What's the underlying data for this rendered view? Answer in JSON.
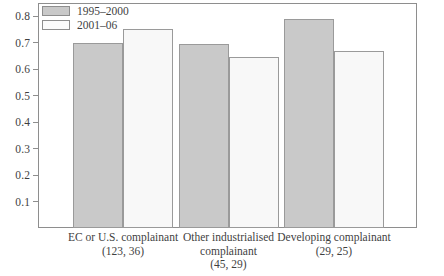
{
  "chart_data": {
    "type": "bar",
    "title": "",
    "subtitle": "",
    "xlabel": "",
    "ylabel": "",
    "ylim": [
      0,
      0.85
    ],
    "grid": false,
    "legend_position": "top-left",
    "categories": [
      "EC or U.S. complainant",
      "Other industrialised complainant",
      "Developing complainant"
    ],
    "category_counts": [
      "(123, 36)",
      "(45, 29)",
      "(29, 25)"
    ],
    "series": [
      {
        "name": "1995–2000",
        "color": "#c9c9c9",
        "values": [
          0.7,
          0.695,
          0.79
        ]
      },
      {
        "name": "2001–06",
        "color": "#f8f8f8",
        "values": [
          0.75,
          0.645,
          0.67
        ]
      }
    ],
    "yticks": [
      0.1,
      0.2,
      0.3,
      0.4,
      0.5,
      0.6,
      0.7,
      0.8
    ],
    "ytick_labels": [
      "0.1",
      "0.2",
      "0.3",
      "0.4",
      "0.5",
      "0.6",
      "0.7",
      "0.8"
    ]
  },
  "legend": {
    "items": [
      {
        "label": "1995–2000"
      },
      {
        "label": "2001–06"
      }
    ]
  }
}
